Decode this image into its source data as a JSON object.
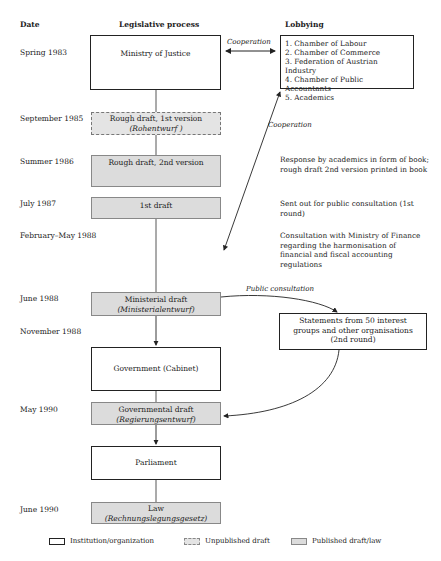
{
  "headers": {
    "date": "Date",
    "legislative": "Legislative process",
    "lobbying": "Lobbying"
  },
  "dates": [
    "Spring 1983",
    "September 1985",
    "Summer 1986",
    "July 1987",
    "February–May 1988",
    "June 1988",
    "November 1988",
    "May 1990",
    "June 1990"
  ],
  "process": {
    "ministry": "Ministry of Justice",
    "rough1": {
      "title": "Rough draft, 1st version",
      "sub": "(Rohentwurf )"
    },
    "rough2": "Rough draft, 2nd version",
    "draft1": "1st draft",
    "ministerial": {
      "title": "Ministerial draft",
      "sub": "(Ministerialentwurf)"
    },
    "government": "Government (Cabinet)",
    "governmental": {
      "title": "Governmental draft",
      "sub": "(Regierungsentwurf)"
    },
    "parliament": "Parliament",
    "law": {
      "title": "Law",
      "sub": "(Rechnungslegungsgesetz)"
    }
  },
  "lobbying": {
    "groups": [
      "1. Chamber of Labour",
      "2. Chamber of Commerce",
      "3. Federation of Austrian Industry",
      "4. Chamber of Public Accountants",
      "5. Academics"
    ],
    "notes": {
      "academics": "Response by academics in form of book; rough draft 2nd version printed in book",
      "consultation1": "Sent out for public consultation (1st round)",
      "finance": "Consultation with Ministry of Finance regarding the harmonisation of financial and fiscal accounting regulations"
    },
    "statements": "Statements from 50 interest groups and other organisations (2nd round)"
  },
  "arrow_labels": {
    "cooperation_top": "Cooperation",
    "cooperation_diag": "Cooperation",
    "public_consultation": "Public consultation"
  },
  "legend": {
    "institution": "Institution/organization",
    "unpublished": "Unpublished draft",
    "published": "Published draft/law"
  },
  "colors": {
    "published_fill": "#dcdcdc",
    "unpublished_fill": "#e4e4e4",
    "line": "#222222"
  }
}
